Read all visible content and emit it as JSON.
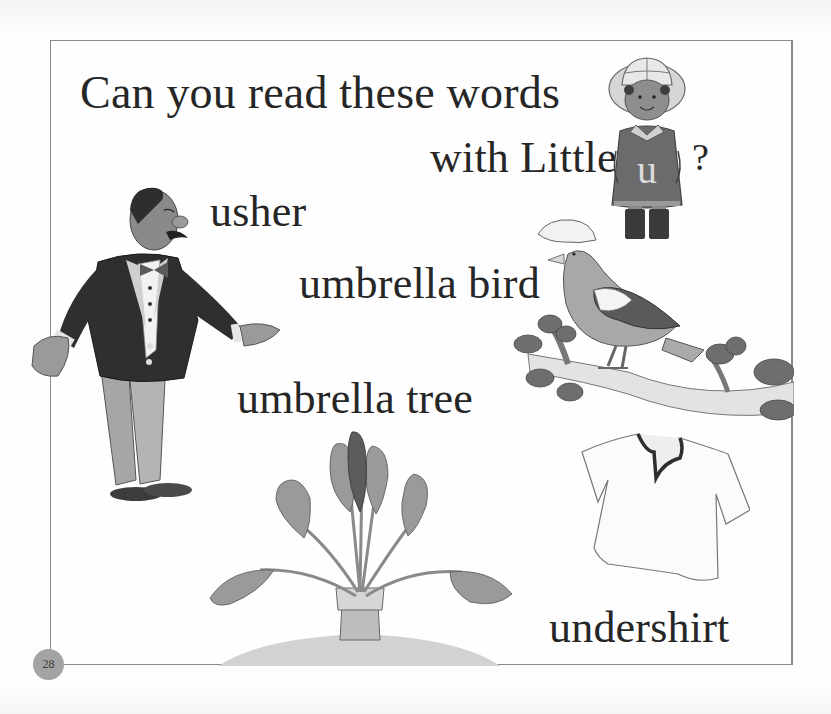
{
  "page": {
    "heading_line1": "Can you read these words",
    "heading_line2": "with Little",
    "heading_end": "?",
    "character_letter": "u",
    "page_number": "28"
  },
  "words": [
    {
      "label": "usher",
      "icon": "usher-illustration"
    },
    {
      "label": "umbrella bird",
      "icon": "umbrella-bird-illustration"
    },
    {
      "label": "umbrella tree",
      "icon": "umbrella-tree-illustration"
    },
    {
      "label": "undershirt",
      "icon": "undershirt-illustration"
    }
  ],
  "colors": {
    "text": "#262626",
    "border": "#8a8a8a",
    "page_number_circle": "#a3a3a3"
  }
}
